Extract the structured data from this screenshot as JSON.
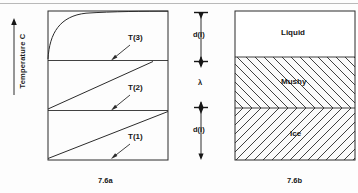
{
  "figure": {
    "axis_label": "Temperature C",
    "axis_arrow": "up-arrow-icon"
  },
  "panel_a": {
    "caption": "7.6a",
    "curves": [
      {
        "label": "T(3)",
        "shape": "concave-rising-saturating"
      },
      {
        "label": "T(2)",
        "shape": "linear-rising"
      },
      {
        "label": "T(1)",
        "shape": "linear-rising"
      }
    ]
  },
  "dimension_axis": {
    "markers": [
      {
        "label": "d(l)",
        "name": "liquid-depth"
      },
      {
        "label": "λ",
        "name": "mushy-thickness"
      },
      {
        "label": "d(i)",
        "name": "ice-depth"
      }
    ]
  },
  "panel_b": {
    "caption": "7.6b",
    "zones": [
      {
        "label": "Liquid",
        "fill": "none"
      },
      {
        "label": "Mushy",
        "fill": "hatch-backslash"
      },
      {
        "label": "Ice",
        "fill": "hatch-forwardslash"
      }
    ]
  },
  "colors": {
    "ink": "#161616",
    "rule": "#b9b9b9",
    "paper": "#fdfdfd"
  }
}
